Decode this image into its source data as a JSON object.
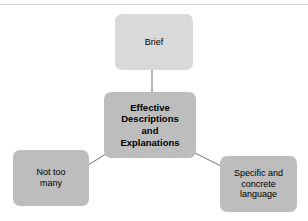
{
  "diagram": {
    "title": "Effective Descriptions and Explanations",
    "type": "hub-and-spoke",
    "center": {
      "id": "effective-descriptions-and-explanations",
      "label": "Effective\nDescriptions\nand\nExplanations",
      "fill": "#bdbdbd"
    },
    "nodes": [
      {
        "id": "brief",
        "label": "Brief",
        "fill": "#d9d9d9",
        "position": "top"
      },
      {
        "id": "not-too-many",
        "label": "Not too\nmany",
        "fill": "#bdbdbd",
        "position": "bottom-left"
      },
      {
        "id": "specific-and-concrete-language",
        "label": "Specific and\nconcrete\nlanguage",
        "fill": "#bdbdbd",
        "position": "bottom-right"
      }
    ],
    "connectors": [
      {
        "id": "center-to-brief",
        "from": "effective-descriptions-and-explanations",
        "to": "brief",
        "color": "#6e6e6e"
      },
      {
        "id": "center-to-not-too-many",
        "from": "effective-descriptions-and-explanations",
        "to": "not-too-many",
        "color": "#6e6e6e"
      },
      {
        "id": "center-to-specific-and-concrete-language",
        "from": "effective-descriptions-and-explanations",
        "to": "specific-and-concrete-language",
        "color": "#6e6e6e"
      }
    ],
    "rule_color": "#d2d2d2",
    "background": "#ffffff"
  }
}
